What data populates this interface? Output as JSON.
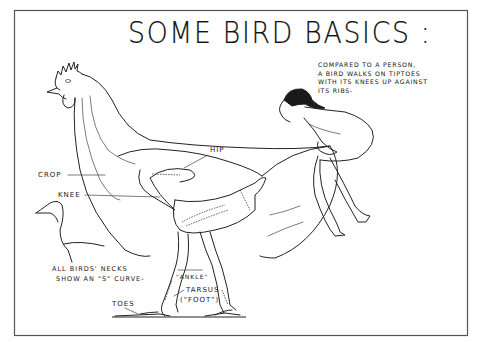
{
  "title": "SOME BIRD BASICS :",
  "note": {
    "lines": [
      "COMPARED TO A PERSON,",
      "A BIRD WALKS ON TIPTOES",
      "WITH ITS KNEES UP AGAINST",
      "ITS RIBS-"
    ]
  },
  "labels": {
    "hip": "HIP",
    "crop": "CROP",
    "knee": "KNEE",
    "neck_note_line1": "ALL BIRDS' NECKS",
    "neck_note_line2": "SHOW AN \"S\" CURVE-",
    "ankle": "\"ANKLE\"",
    "tarsus": "TARSUS",
    "foot": "(\"FOOT\")",
    "toes": "TOES"
  },
  "figures": {
    "chicken": "chicken-skeleton-illustration",
    "person": "crouching-person-illustration",
    "swan": "s-curve-neck-bird-outline"
  }
}
